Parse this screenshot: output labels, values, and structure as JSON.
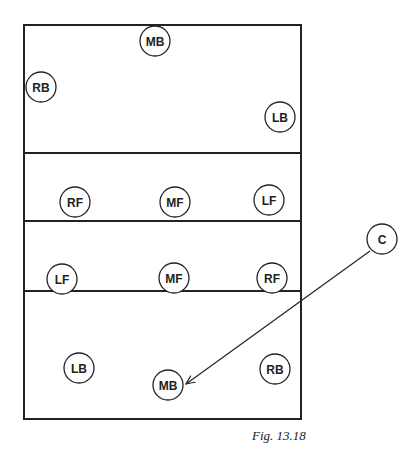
{
  "diagram": {
    "caption": "Fig. 13.18",
    "colors": {
      "line": "#222222",
      "background": "#ffffff"
    },
    "court": {
      "x": 24,
      "y": 25,
      "width": 277,
      "height": 394
    },
    "dividers": [
      153,
      221,
      291
    ],
    "players": [
      {
        "label": "MB",
        "x": 155,
        "y": 41
      },
      {
        "label": "RB",
        "x": 41,
        "y": 87
      },
      {
        "label": "LB",
        "x": 280,
        "y": 117
      },
      {
        "label": "RF",
        "x": 75,
        "y": 202
      },
      {
        "label": "MF",
        "x": 175,
        "y": 202
      },
      {
        "label": "LF",
        "x": 269,
        "y": 200
      },
      {
        "label": "LF",
        "x": 62,
        "y": 279
      },
      {
        "label": "MF",
        "x": 174,
        "y": 278
      },
      {
        "label": "RF",
        "x": 272,
        "y": 278
      },
      {
        "label": "LB",
        "x": 79,
        "y": 368
      },
      {
        "label": "MB",
        "x": 168,
        "y": 385
      },
      {
        "label": "RB",
        "x": 275,
        "y": 369
      }
    ],
    "coach": {
      "label": "C",
      "x": 382,
      "y": 239
    },
    "arrow": {
      "from": [
        370,
        251
      ],
      "to": [
        186,
        384
      ]
    }
  }
}
